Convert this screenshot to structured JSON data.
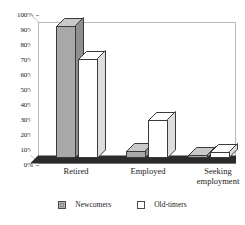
{
  "chart_data": {
    "type": "bar",
    "title": "",
    "subtitle": "",
    "xlabel": "",
    "ylabel": "",
    "categories": [
      "Retired",
      "Employed",
      "Seeking employment"
    ],
    "category_lines": [
      [
        "Retired"
      ],
      [
        "Employed"
      ],
      [
        "Seeking",
        "employment"
      ]
    ],
    "series": [
      {
        "name": "Newcomers",
        "values": [
          93,
          5,
          2
        ],
        "color": "#a8a8a8"
      },
      {
        "name": "Old-timers",
        "values": [
          70,
          27,
          4
        ],
        "color": "#ffffff"
      }
    ],
    "ylim": [
      0,
      100
    ],
    "ytick_values": [
      0,
      10,
      20,
      30,
      40,
      50,
      60,
      70,
      80,
      90,
      100
    ],
    "ytick_labels": [
      "0%",
      "10%",
      "20%",
      "30%",
      "40%",
      "50%",
      "60%",
      "70%",
      "80%",
      "90%",
      "100%"
    ],
    "value_format": "percent",
    "grid": false,
    "legend_position": "bottom",
    "style": "3d-column",
    "colors": {
      "newcomers_fill": "#a8a8a8",
      "oldtimers_fill": "#ffffff",
      "bar_outline": "#3a3a3a",
      "floor": "#2b2b2b",
      "frame": "#b9b9b9",
      "text": "#1a1a1a"
    }
  },
  "legend": {
    "items": [
      {
        "label": "Newcomers",
        "swatch": "gray"
      },
      {
        "label": "Old-timers",
        "swatch": "white"
      }
    ]
  }
}
